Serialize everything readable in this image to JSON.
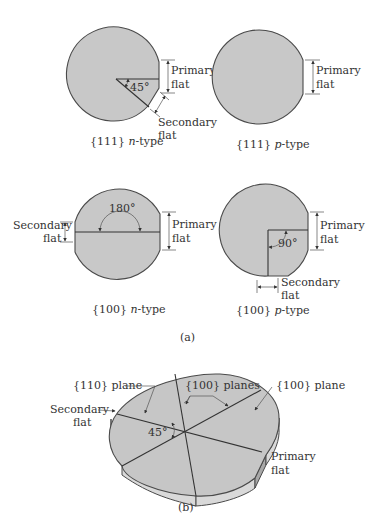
{
  "figure_a": {
    "label": "(a)",
    "wafers": [
      {
        "id": "111-n",
        "caption_prefix": "{111} ",
        "caption_type": "n",
        "caption_suffix": "-type",
        "primary_flat": {
          "line1": "Primary",
          "line2": "flat"
        },
        "secondary_flat": {
          "line1": "Secondary",
          "line2": "flat"
        },
        "angle": "45°"
      },
      {
        "id": "111-p",
        "caption_prefix": "{111} ",
        "caption_type": "p",
        "caption_suffix": "-type",
        "primary_flat": {
          "line1": "Primary",
          "line2": "flat"
        }
      },
      {
        "id": "100-n",
        "caption_prefix": "{100} ",
        "caption_type": "n",
        "caption_suffix": "-type",
        "primary_flat": {
          "line1": "Primary",
          "line2": "flat"
        },
        "secondary_flat": {
          "line1": "Secondary",
          "line2": "flat"
        },
        "angle": "180°"
      },
      {
        "id": "100-p",
        "caption_prefix": "{100} ",
        "caption_type": "p",
        "caption_suffix": "-type",
        "primary_flat": {
          "line1": "Primary",
          "line2": "flat"
        },
        "secondary_flat": {
          "line1": "Secondary",
          "line2": "flat"
        },
        "angle": "90°"
      }
    ]
  },
  "figure_b": {
    "label": "(b)",
    "labels": {
      "plane_110": "{110} plane",
      "planes_100": "{100} planes",
      "plane_100": "{100} plane",
      "secondary_flat_1": "Secondary",
      "secondary_flat_2": "flat",
      "primary_flat_1": "Primary",
      "primary_flat_2": "flat",
      "angle": "45°"
    }
  },
  "colors": {
    "wafer_fill": "#c8c8c8",
    "outline": "#4a4a4a",
    "text": "#333333",
    "background": "#ffffff"
  }
}
